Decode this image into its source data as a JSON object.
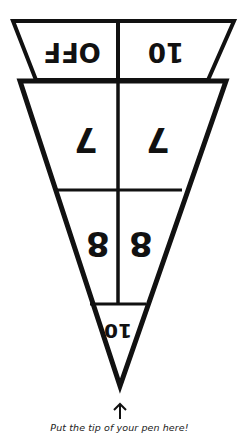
{
  "diagram": {
    "top_band": {
      "left_label": "OFF",
      "right_label": "10",
      "orientation": "upside-down"
    },
    "upper_section": {
      "left_label": "7",
      "right_label": "7",
      "orientation": "upside-down"
    },
    "middle_section": {
      "left_label": "8",
      "right_label": "8",
      "orientation": "upside-down"
    },
    "tip_section": {
      "label": "10",
      "orientation": "upside-down"
    },
    "stroke_color": "#111111",
    "background_color": "#ffffff"
  },
  "pointer": {
    "arrow_icon": "up-arrow",
    "caption": "Put the tip of your pen here!"
  }
}
